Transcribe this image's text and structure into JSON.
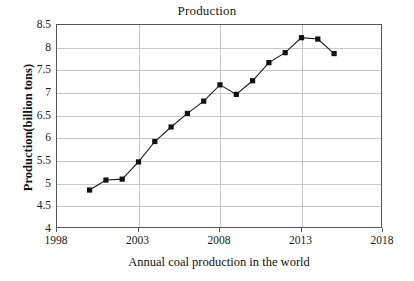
{
  "chart_data": {
    "type": "line",
    "title": "Production",
    "xlabel": "Annual coal production in the world",
    "ylabel": "Production(billion tons)",
    "grid": true,
    "legend": "none",
    "xlim": [
      1998,
      2018
    ],
    "ylim": [
      4,
      8.5
    ],
    "xticks": [
      "1998",
      "2003",
      "2008",
      "2013",
      "2018"
    ],
    "xtick_values": [
      1998,
      2003,
      2008,
      2013,
      2018
    ],
    "yticks": [
      "4",
      "4.5",
      "5",
      "5.5",
      "6",
      "6.5",
      "7",
      "7.5",
      "8",
      "8.5"
    ],
    "ytick_values": [
      4,
      4.5,
      5,
      5.5,
      6,
      6.5,
      7,
      7.5,
      8,
      8.5
    ],
    "marker": "square",
    "marker_color": "#111111",
    "line_color": "#1a1a1a",
    "x": [
      2000,
      2001,
      2002,
      2003,
      2004,
      2005,
      2006,
      2007,
      2008,
      2009,
      2010,
      2011,
      2012,
      2013,
      2014,
      2015
    ],
    "values": [
      4.86,
      5.08,
      5.1,
      5.48,
      5.93,
      6.25,
      6.55,
      6.82,
      7.18,
      6.97,
      7.27,
      7.67,
      7.89,
      8.22,
      8.19,
      7.87
    ],
    "series": [
      {
        "name": "Production",
        "x": [
          2000,
          2001,
          2002,
          2003,
          2004,
          2005,
          2006,
          2007,
          2008,
          2009,
          2010,
          2011,
          2012,
          2013,
          2014,
          2015
        ],
        "values": [
          4.86,
          5.08,
          5.1,
          5.48,
          5.93,
          6.25,
          6.55,
          6.82,
          7.18,
          6.97,
          7.27,
          7.67,
          7.89,
          8.22,
          8.19,
          7.87
        ]
      }
    ]
  }
}
